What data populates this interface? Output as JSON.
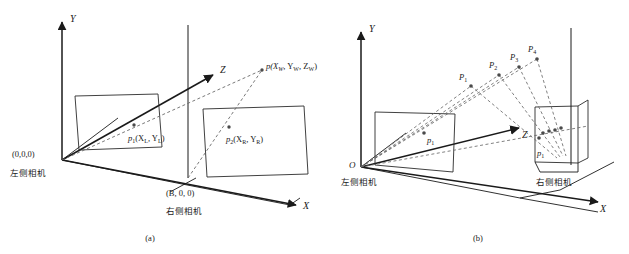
{
  "figure": {
    "line_color": "#1a1a1a",
    "dash_color": "#6a6a6a",
    "plane_color": "#2b2b2b",
    "point_color": "#4a4a4a"
  },
  "panel_a": {
    "caption": "(a)",
    "axes": {
      "x": "X",
      "y": "Y",
      "z": "Z"
    },
    "origin_label": "(0,0,0)",
    "left_camera_label": "左侧相机",
    "baseline_origin_label": "(B, 0, 0)",
    "right_camera_label": "右侧相机",
    "world_point_label": "p(XW, YW, ZW)",
    "world_point_parts": {
      "base": "p(X",
      "sub1": "W",
      "mid1": ", Y",
      "sub2": "W",
      "mid2": ", Z",
      "sub3": "W",
      "close": ")"
    },
    "left_projection_parts": {
      "base": "p",
      "index": "1",
      "open": "(X",
      "sub1": "L",
      "mid": ", Y",
      "sub2": "L",
      "close": ")"
    },
    "right_projection_parts": {
      "base": "p",
      "index": "2",
      "open": "(X",
      "sub1": "R",
      "mid": ", Y",
      "sub2": "R",
      "close": ")"
    }
  },
  "panel_b": {
    "caption": "(b)",
    "axes": {
      "x": "X",
      "y": "Y",
      "z": "Z"
    },
    "origin_label": "O",
    "left_camera_label": "左侧相机",
    "right_camera_label": "右侧相机",
    "world_points": [
      {
        "base": "P",
        "index": "1"
      },
      {
        "base": "P",
        "index": "2"
      },
      {
        "base": "P",
        "index": "3"
      },
      {
        "base": "P",
        "index": "4"
      }
    ],
    "left_projection": {
      "base": "p",
      "index": "1"
    },
    "right_projection": {
      "base": "p",
      "index": "1"
    }
  }
}
